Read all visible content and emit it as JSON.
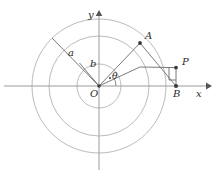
{
  "figure": {
    "background": "#ffffff",
    "stroke_light": "#a9a9a9",
    "stroke_dark": "#555555",
    "text_color": "#2b2b2b",
    "width": 218,
    "height": 175
  },
  "axes": {
    "origin": {
      "x": 99,
      "y": 86,
      "label": "O"
    },
    "x_axis": {
      "label": "x",
      "from_x": 4,
      "to_x": 208,
      "y": 86,
      "arrow": "right"
    },
    "y_axis": {
      "label": "y",
      "x": 99,
      "from_y": 168,
      "to_y": 14,
      "arrow": "up"
    }
  },
  "circles": [
    {
      "name": "inner-circle",
      "cx": 99,
      "cy": 86,
      "r": 22
    },
    {
      "name": "middle-circle",
      "cx": 99,
      "cy": 86,
      "r": 50
    },
    {
      "name": "outer-circle",
      "cx": 99,
      "cy": 86,
      "r": 67
    }
  ],
  "points": [
    {
      "name": "A",
      "label": "A",
      "x": 140,
      "y": 43
    },
    {
      "name": "P",
      "label": "P",
      "x": 176,
      "y": 68
    },
    {
      "name": "B",
      "label": "B",
      "x": 176,
      "y": 86
    },
    {
      "name": "C",
      "label": "",
      "x": 140,
      "y": 67
    }
  ],
  "segments": [
    {
      "name": "radius-a",
      "x1": 99,
      "y1": 86,
      "x2": 52,
      "y2": 38,
      "label": "a"
    },
    {
      "name": "radius-b",
      "x1": 99,
      "y1": 86,
      "x2": 79,
      "y2": 62,
      "label": "b"
    },
    {
      "name": "ray-OA",
      "x1": 99,
      "y1": 86,
      "x2": 140,
      "y2": 43,
      "label": ""
    },
    {
      "name": "ray-OC",
      "x1": 99,
      "y1": 86,
      "x2": 140,
      "y2": 67,
      "label": ""
    },
    {
      "name": "segment-CP",
      "x1": 140,
      "y1": 67,
      "x2": 176,
      "y2": 68,
      "label": ""
    },
    {
      "name": "segment-AB",
      "x1": 140,
      "y1": 43,
      "x2": 176,
      "y2": 86,
      "label": ""
    },
    {
      "name": "segment-PB",
      "x1": 176,
      "y1": 68,
      "x2": 176,
      "y2": 86,
      "label": ""
    }
  ],
  "labels": {
    "a": "a",
    "b": "b",
    "theta": "θ",
    "O": "O",
    "A": "A",
    "P": "P",
    "B": "B",
    "x": "x",
    "y": "y"
  },
  "angle_arc": {
    "name": "theta-arc",
    "vertex_x": 99,
    "vertex_y": 86,
    "radius": 17,
    "start_deg": 0,
    "end_deg": 27,
    "label": "θ"
  },
  "right_angle_mark": {
    "name": "right-angle-at-P",
    "x": 176,
    "y": 68,
    "size": 7,
    "direction": "lower-left"
  }
}
